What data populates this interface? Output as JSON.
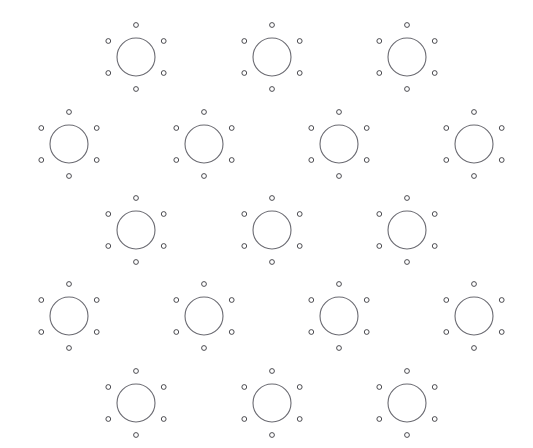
{
  "figure": {
    "width": 533,
    "height": 448,
    "background_color": "#ffffff"
  },
  "chart_data": {
    "type": "scatter",
    "subtitle": "",
    "xlabel": "",
    "ylabel": "",
    "xlim": [
      0,
      533
    ],
    "ylim": [
      0,
      448
    ],
    "grid": false,
    "legend_position": "none",
    "annotations": [],
    "tick_labels_x": [],
    "tick_labels_y": [],
    "axes_visible": false,
    "style": {
      "large_circle_stroke": "#6b6b72",
      "large_circle_fill": "none",
      "large_circle_stroke_width": 1.1,
      "large_circle_radius": 19.0,
      "small_circle_stroke": "#3a3a40",
      "small_circle_fill": "#ffffff",
      "small_circle_stroke_width": 0.9,
      "small_circle_radius": 2.4,
      "satellite_orbit_radius": 32.0,
      "satellite_angles_deg": [
        90,
        150,
        210,
        270,
        330,
        30
      ]
    },
    "lattice": {
      "description": "Triangular (hexagonal) Bravais lattice of large ring motifs, each encircled by six small rings",
      "row_spacing_y": 86.5,
      "column_spacing_x": 135.5,
      "row_offset_x": 67.75,
      "rows": [
        {
          "index": 1,
          "y": 57,
          "x_centers": [
            136,
            272,
            407
          ]
        },
        {
          "index": 2,
          "y": 144,
          "x_centers": [
            69,
            204,
            339,
            474
          ]
        },
        {
          "index": 3,
          "y": 230,
          "x_centers": [
            136,
            272,
            407
          ]
        },
        {
          "index": 4,
          "y": 316,
          "x_centers": [
            69,
            204,
            339,
            474
          ]
        },
        {
          "index": 5,
          "y": 403,
          "x_centers": [
            136,
            272,
            407
          ]
        }
      ]
    },
    "series": [
      {
        "name": "large-rings",
        "marker": "open-circle",
        "radius": 19.0,
        "color": "#6b6b72",
        "points": [
          [
            136,
            57
          ],
          [
            272,
            57
          ],
          [
            407,
            57
          ],
          [
            69,
            144
          ],
          [
            204,
            144
          ],
          [
            339,
            144
          ],
          [
            474,
            144
          ],
          [
            136,
            230
          ],
          [
            272,
            230
          ],
          [
            407,
            230
          ],
          [
            69,
            316
          ],
          [
            204,
            316
          ],
          [
            339,
            316
          ],
          [
            474,
            316
          ],
          [
            136,
            403
          ],
          [
            272,
            403
          ],
          [
            407,
            403
          ]
        ]
      },
      {
        "name": "satellite-rings",
        "marker": "small-open-circle",
        "radius": 2.4,
        "color": "#3a3a40",
        "note": "Six satellites per large ring at 32 px radius, angles 30/90/150/210/270/330 degrees",
        "count_per_motif": 6,
        "total_count": 102
      }
    ],
    "counts": {
      "large_rings": 17,
      "rows": 5,
      "satellites_per_ring": 6
    }
  }
}
